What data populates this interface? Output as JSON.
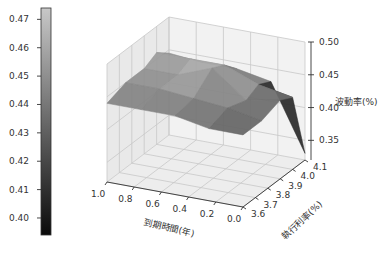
{
  "chart_data": {
    "type": "surface3d",
    "title": "",
    "xlabel": "到期時間(年)",
    "ylabel": "執行利率(%)",
    "zlabel": "波動率(%)",
    "x_ticks": [
      "0.0",
      "0.2",
      "0.4",
      "0.6",
      "0.8",
      "1.0"
    ],
    "y_ticks": [
      "3.6",
      "3.7",
      "3.8",
      "3.9",
      "4.0",
      "4.1"
    ],
    "z_ticks": [
      "0.35",
      "0.40",
      "0.45",
      "0.50"
    ],
    "xlim": [
      0.0,
      1.0
    ],
    "ylim": [
      3.6,
      4.1
    ],
    "zlim": [
      0.32,
      0.5
    ],
    "x": [
      0.0,
      0.25,
      0.5,
      0.75,
      1.0
    ],
    "y": [
      3.6,
      3.75,
      3.9,
      4.0,
      4.1
    ],
    "z": [
      [
        0.43,
        0.43,
        0.44,
        0.44,
        0.44
      ],
      [
        0.43,
        0.44,
        0.445,
        0.45,
        0.45
      ],
      [
        0.44,
        0.43,
        0.47,
        0.45,
        0.45
      ],
      [
        0.43,
        0.44,
        0.46,
        0.46,
        0.46
      ],
      [
        0.33,
        0.43,
        0.44,
        0.44,
        0.445
      ]
    ],
    "colorbar": {
      "ticks": [
        "0.40",
        "0.41",
        "0.42",
        "0.43",
        "0.44",
        "0.45",
        "0.46",
        "0.47"
      ],
      "range": [
        0.394,
        0.474
      ],
      "colormap": "gray"
    },
    "grid": true,
    "legend": "none"
  }
}
